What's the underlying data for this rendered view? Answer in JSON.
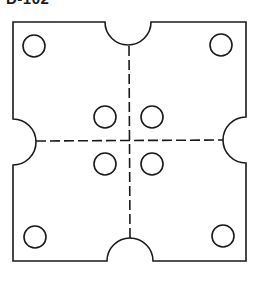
{
  "figure": {
    "label": "D-102",
    "label_cropped": true
  },
  "geometry": {
    "stroke_color": "#1a1a1a",
    "background": "#ffffff",
    "plate": {
      "left": 13,
      "top": 22,
      "right": 246,
      "bottom": 261
    },
    "notches": [
      {
        "side": "top",
        "cx": 128,
        "cy": 22,
        "r": 23
      },
      {
        "side": "right",
        "cx": 246,
        "cy": 140,
        "r": 23
      },
      {
        "side": "bottom",
        "cx": 130,
        "cy": 261,
        "r": 23
      },
      {
        "side": "left",
        "cx": 13,
        "cy": 142,
        "r": 23
      }
    ],
    "holes": [
      {
        "name": "top-left",
        "cx": 34,
        "cy": 46,
        "r": 11
      },
      {
        "name": "top-right",
        "cx": 221,
        "cy": 45,
        "r": 11
      },
      {
        "name": "bottom-left",
        "cx": 35,
        "cy": 237,
        "r": 11
      },
      {
        "name": "bottom-right",
        "cx": 223,
        "cy": 236,
        "r": 11
      },
      {
        "name": "center-upper-left",
        "cx": 105,
        "cy": 117,
        "r": 11
      },
      {
        "name": "center-upper-right",
        "cx": 152,
        "cy": 117,
        "r": 11
      },
      {
        "name": "center-lower-left",
        "cx": 105,
        "cy": 164,
        "r": 11
      },
      {
        "name": "center-lower-right",
        "cx": 152,
        "cy": 164,
        "r": 11
      }
    ],
    "centerlines": [
      {
        "orientation": "vertical",
        "x": 129,
        "y1": 46,
        "y2": 238
      },
      {
        "orientation": "horizontal",
        "y": 141,
        "x1": 36,
        "x2": 223
      }
    ]
  }
}
